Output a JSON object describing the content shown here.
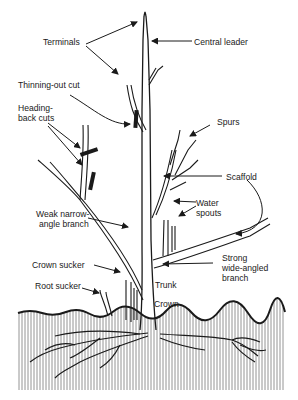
{
  "diagram": {
    "type": "labeled illustration",
    "labels": {
      "terminals": "Terminals",
      "central_leader": "Central leader",
      "thinning_out_cut": "Thinning-out cut",
      "heading_back_cuts_1": "Heading-",
      "heading_back_cuts_2": "back cuts",
      "spurs": "Spurs",
      "scaffold": "Scaffold",
      "water_spouts_1": "Water",
      "water_spouts_2": "spouts",
      "weak_branch_1": "Weak narrow-",
      "weak_branch_2": "angle branch",
      "crown_sucker": "Crown sucker",
      "root_sucker": "Root sucker",
      "strong_branch_1": "Strong",
      "strong_branch_2": "wide-angled",
      "strong_branch_3": "branch",
      "trunk": "Trunk",
      "crown": "Crown"
    },
    "colors": {
      "ink": "#1a1a1a",
      "soil_hatch": "#6e6e6e",
      "background": "#ffffff"
    }
  }
}
